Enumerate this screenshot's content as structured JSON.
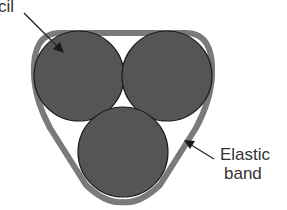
{
  "labels": {
    "pencil": "cil",
    "band_line1": "Elastic",
    "band_line2": "band"
  },
  "colors": {
    "pencil_fill": "#555555",
    "pencil_stroke": "#1e1e1e",
    "band": "#7a7a7a",
    "arrow": "#2a2a2a",
    "background": "#ffffff"
  },
  "shapes": {
    "pencils": [
      {
        "name": "pencil-top-left",
        "cx": 79,
        "cy": 76,
        "r": 45
      },
      {
        "name": "pencil-top-right",
        "cx": 167,
        "cy": 76,
        "r": 45
      },
      {
        "name": "pencil-bottom",
        "cx": 123,
        "cy": 152,
        "r": 45
      }
    ]
  }
}
